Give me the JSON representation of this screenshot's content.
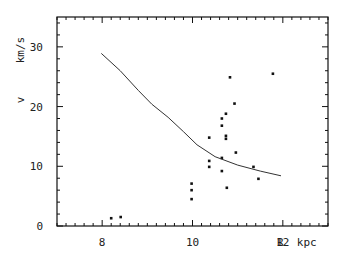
{
  "chart_data": {
    "type": "scatter",
    "title": "",
    "xlabel": "R kpc",
    "ylabel": "v_z km/s",
    "xlim": [
      7,
      13
    ],
    "ylim": [
      0,
      35
    ],
    "xticks": [
      8,
      10,
      12
    ],
    "xtick_labels": [
      "8",
      "10",
      "12"
    ],
    "yticks": [
      0,
      10,
      20,
      30
    ],
    "ytick_labels": [
      "0",
      "10",
      "20",
      "30"
    ],
    "grid": false,
    "legend": null,
    "series": [
      {
        "name": "observations",
        "kind": "scatter",
        "points": [
          [
            8.2,
            1.3
          ],
          [
            8.41,
            1.5
          ],
          [
            9.98,
            7.1
          ],
          [
            9.98,
            6.0
          ],
          [
            9.98,
            4.5
          ],
          [
            10.37,
            14.8
          ],
          [
            10.37,
            10.9
          ],
          [
            10.37,
            9.9
          ],
          [
            10.65,
            18.0
          ],
          [
            10.65,
            16.8
          ],
          [
            10.65,
            11.4
          ],
          [
            10.65,
            9.2
          ],
          [
            10.74,
            18.8
          ],
          [
            10.74,
            15.1
          ],
          [
            10.74,
            14.6
          ],
          [
            10.76,
            6.4
          ],
          [
            10.83,
            24.9
          ],
          [
            10.93,
            20.5
          ],
          [
            10.96,
            12.3
          ],
          [
            11.35,
            9.9
          ],
          [
            11.46,
            7.9
          ],
          [
            11.78,
            25.5
          ]
        ]
      },
      {
        "name": "model curve",
        "kind": "line",
        "points": [
          [
            7.98,
            28.9
          ],
          [
            8.4,
            26.0
          ],
          [
            8.8,
            22.7
          ],
          [
            9.1,
            20.4
          ],
          [
            9.46,
            18.2
          ],
          [
            9.8,
            15.8
          ],
          [
            10.1,
            13.6
          ],
          [
            10.5,
            11.6
          ],
          [
            11.0,
            10.2
          ],
          [
            11.5,
            9.2
          ],
          [
            11.96,
            8.4
          ]
        ]
      }
    ]
  },
  "axes": {
    "x_label": "R  kpc",
    "y_label_vz": "v",
    "y_label_units": "km/s"
  }
}
